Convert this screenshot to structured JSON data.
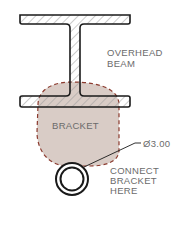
{
  "labels": {
    "beam": [
      "OVERHEAD",
      "BEAM"
    ],
    "bracket": "BRACKET",
    "dimension": "Ø3.00",
    "connect": [
      "CONNECT",
      "BRACKET",
      "HERE"
    ]
  },
  "colors": {
    "line": "#1a1a1a",
    "hatch": "#9a9a9a",
    "bracket_fill": "#d9ccc6",
    "bracket_outline": "#8b3a2e",
    "text": "#6b6b6b"
  }
}
